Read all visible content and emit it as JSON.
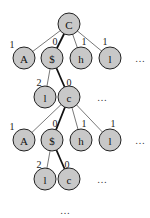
{
  "diagram": {
    "type": "tree",
    "nodes": [
      {
        "id": "n0",
        "label": "C",
        "x": 69,
        "y": 24
      },
      {
        "id": "n1",
        "label": "A",
        "x": 24,
        "y": 58
      },
      {
        "id": "n2",
        "label": "$",
        "x": 52,
        "y": 58
      },
      {
        "id": "n3",
        "label": "h",
        "x": 81,
        "y": 58
      },
      {
        "id": "n4",
        "label": "l",
        "x": 110,
        "y": 58
      },
      {
        "id": "n5",
        "label": "l",
        "x": 45,
        "y": 97
      },
      {
        "id": "n6",
        "label": "c",
        "x": 69,
        "y": 97
      },
      {
        "id": "n7",
        "label": "A",
        "x": 24,
        "y": 140
      },
      {
        "id": "n8",
        "label": "$",
        "x": 52,
        "y": 140
      },
      {
        "id": "n9",
        "label": "h",
        "x": 81,
        "y": 140
      },
      {
        "id": "n10",
        "label": "l",
        "x": 110,
        "y": 140
      },
      {
        "id": "n11",
        "label": "l",
        "x": 45,
        "y": 179
      },
      {
        "id": "n12",
        "label": "c",
        "x": 69,
        "y": 179
      }
    ],
    "edges": [
      {
        "from": "n0",
        "to": "n1",
        "label": "1",
        "bold": false,
        "lx": 12,
        "ly": 48
      },
      {
        "from": "n0",
        "to": "n2",
        "label": "0",
        "bold": true,
        "lx": 55,
        "ly": 45
      },
      {
        "from": "n0",
        "to": "n3",
        "label": "1",
        "bold": false,
        "lx": 84,
        "ly": 45
      },
      {
        "from": "n0",
        "to": "n4",
        "label": "1",
        "bold": false,
        "lx": 105,
        "ly": 45
      },
      {
        "from": "n2",
        "to": "n5",
        "label": "2",
        "bold": false,
        "lx": 39,
        "ly": 86
      },
      {
        "from": "n2",
        "to": "n6",
        "label": "0",
        "bold": true,
        "lx": 69,
        "ly": 86
      },
      {
        "from": "n6",
        "to": "n7",
        "label": "1",
        "bold": false,
        "lx": 12,
        "ly": 130
      },
      {
        "from": "n6",
        "to": "n8",
        "label": "0",
        "bold": true,
        "lx": 55,
        "ly": 127
      },
      {
        "from": "n6",
        "to": "n9",
        "label": "1",
        "bold": false,
        "lx": 84,
        "ly": 127
      },
      {
        "from": "n6",
        "to": "n10",
        "label": "1",
        "bold": false,
        "lx": 113,
        "ly": 127
      },
      {
        "from": "n8",
        "to": "n11",
        "label": "2",
        "bold": false,
        "lx": 39,
        "ly": 168
      },
      {
        "from": "n8",
        "to": "n12",
        "label": "0",
        "bold": true,
        "lx": 67,
        "ly": 168
      }
    ],
    "ellipses": [
      {
        "text": "…",
        "x": 140,
        "y": 62
      },
      {
        "text": "…",
        "x": 102,
        "y": 101
      },
      {
        "text": "…",
        "x": 140,
        "y": 144
      },
      {
        "text": "…",
        "x": 102,
        "y": 183
      },
      {
        "text": "…",
        "x": 65,
        "y": 214
      }
    ],
    "node_radius": 11,
    "colors": {
      "node_fill": "#c8c8c8",
      "node_stroke": "#222222",
      "edge": "#555555",
      "bold_edge": "#111111"
    }
  }
}
